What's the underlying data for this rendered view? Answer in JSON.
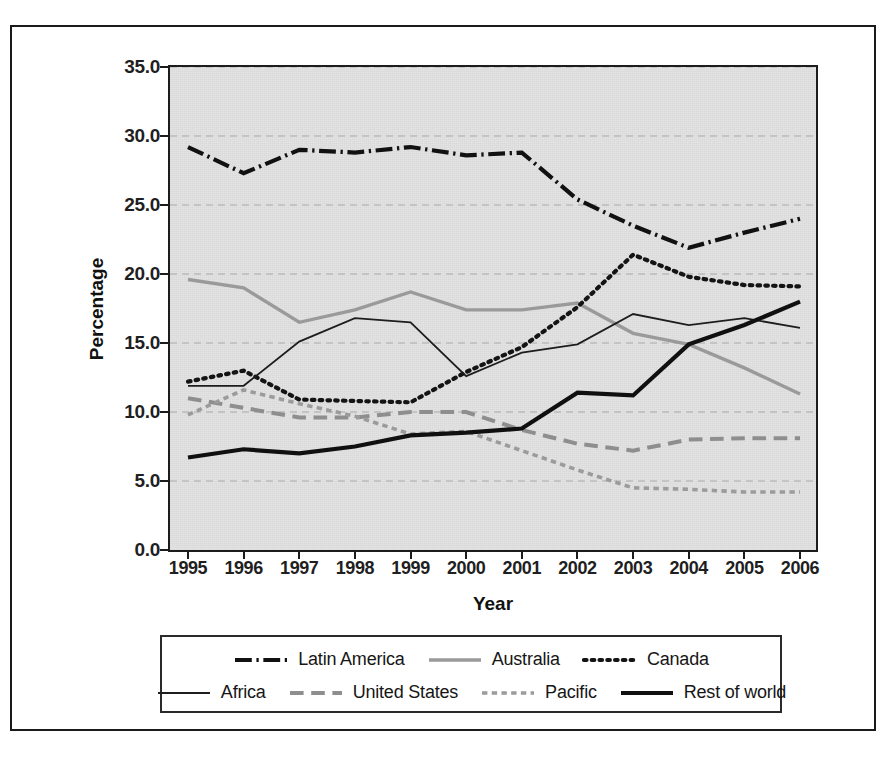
{
  "chart_data": {
    "type": "line",
    "title": "",
    "xlabel": "Year",
    "ylabel": "Percentage",
    "x": [
      1995,
      1996,
      1997,
      1998,
      1999,
      2000,
      2001,
      2002,
      2003,
      2004,
      2005,
      2006
    ],
    "xtick_labels": [
      "1995",
      "1996",
      "1997",
      "1998",
      "1999",
      "2000",
      "2001",
      "2002",
      "2003",
      "2004",
      "2005",
      "2006"
    ],
    "ytick_labels": [
      "0.0",
      "5.0",
      "10.0",
      "15.0",
      "20.0",
      "25.0",
      "30.0",
      "35.0"
    ],
    "ytick_values": [
      0,
      5,
      10,
      15,
      20,
      25,
      30,
      35
    ],
    "ylim": [
      0,
      35
    ],
    "grid": "horizontal-dashed",
    "legend_position": "bottom",
    "plot_background": "#e3e3e3",
    "series": [
      {
        "name": "Latin America",
        "style": "dash-dot",
        "color": "#111111",
        "width": 4.2,
        "values": [
          29.2,
          27.3,
          29.0,
          28.8,
          29.2,
          28.6,
          28.8,
          25.4,
          23.5,
          21.9,
          23.0,
          24.0
        ]
      },
      {
        "name": "Australia",
        "style": "solid",
        "color": "#9a9a9a",
        "width": 3.4,
        "values": [
          19.6,
          19.0,
          16.5,
          17.4,
          18.7,
          17.4,
          17.4,
          17.9,
          15.7,
          14.9,
          13.2,
          11.3
        ]
      },
      {
        "name": "Canada",
        "style": "dotted",
        "color": "#141414",
        "width": 4.2,
        "values": [
          12.2,
          13.0,
          10.9,
          10.8,
          10.7,
          12.9,
          14.7,
          17.6,
          21.4,
          19.8,
          19.2,
          19.1
        ]
      },
      {
        "name": "Africa",
        "style": "solid",
        "color": "#1d1d1d",
        "width": 1.8,
        "values": [
          11.9,
          11.9,
          15.1,
          16.8,
          16.5,
          12.6,
          14.3,
          14.9,
          17.1,
          16.3,
          16.8,
          16.1
        ]
      },
      {
        "name": "United States",
        "style": "long-dash",
        "color": "#8e8e8e",
        "width": 4.0,
        "values": [
          11.0,
          10.3,
          9.6,
          9.6,
          10.0,
          10.0,
          8.7,
          7.7,
          7.2,
          8.0,
          8.1,
          8.1
        ]
      },
      {
        "name": "Pacific",
        "style": "short-dash",
        "color": "#9b9b9b",
        "width": 3.6,
        "values": [
          9.8,
          11.6,
          10.6,
          9.7,
          8.4,
          8.6,
          7.2,
          5.8,
          4.5,
          4.4,
          4.2,
          4.2
        ]
      },
      {
        "name": "Rest of world",
        "style": "solid",
        "color": "#101010",
        "width": 4.2,
        "values": [
          6.7,
          7.3,
          7.0,
          7.5,
          8.3,
          8.5,
          8.8,
          11.4,
          11.2,
          14.9,
          16.3,
          18.0
        ]
      }
    ]
  },
  "axes": {
    "y_title": "Percentage",
    "x_title": "Year"
  },
  "legend": {
    "rows": [
      [
        {
          "label": "Latin America",
          "style": "dash-dot",
          "color": "#111111",
          "width": 4.2
        },
        {
          "label": "Australia",
          "style": "solid",
          "color": "#9a9a9a",
          "width": 3.4
        },
        {
          "label": "Canada",
          "style": "dotted",
          "color": "#141414",
          "width": 4.2
        }
      ],
      [
        {
          "label": "Africa",
          "style": "solid",
          "color": "#1d1d1d",
          "width": 1.8
        },
        {
          "label": "United States",
          "style": "long-dash",
          "color": "#8e8e8e",
          "width": 4.0
        },
        {
          "label": "Pacific",
          "style": "short-dash",
          "color": "#9b9b9b",
          "width": 3.6
        },
        {
          "label": "Rest of world",
          "style": "solid",
          "color": "#101010",
          "width": 4.2
        }
      ]
    ]
  }
}
